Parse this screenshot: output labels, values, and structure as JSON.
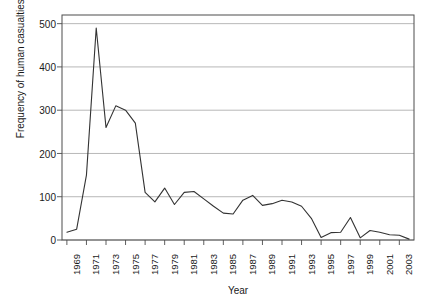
{
  "chart_data": {
    "type": "line",
    "title": "",
    "xlabel": "Year",
    "ylabel": "Frequency of human casualties (death)",
    "xlim": [
      1968.5,
      2004.5
    ],
    "ylim": [
      0,
      520
    ],
    "grid": true,
    "legend": null,
    "y_ticks": [
      500,
      400,
      300,
      200,
      100,
      0
    ],
    "y_tick_labels": [
      "500",
      "400",
      "300",
      "200",
      "100",
      "0"
    ],
    "x_ticks": [
      1969,
      1971,
      1973,
      1975,
      1977,
      1979,
      1981,
      1983,
      1985,
      1987,
      1989,
      1991,
      1993,
      1995,
      1997,
      1999,
      2001,
      2003
    ],
    "x_tick_labels": [
      "1969",
      "1971",
      "1973",
      "1975",
      "1977",
      "1979",
      "1981",
      "1983",
      "1985",
      "1987",
      "1989",
      "1991",
      "1993",
      "1995",
      "1997",
      "1999",
      "2001",
      "2003"
    ],
    "line_color": "#333333",
    "grid_color": "#999999",
    "x": [
      1969,
      1970,
      1971,
      1972,
      1973,
      1974,
      1975,
      1976,
      1977,
      1978,
      1979,
      1980,
      1981,
      1982,
      1983,
      1984,
      1985,
      1986,
      1987,
      1988,
      1989,
      1990,
      1991,
      1992,
      1993,
      1994,
      1995,
      1996,
      1997,
      1998,
      1999,
      2000,
      2001,
      2002,
      2003,
      2004
    ],
    "values": [
      18,
      25,
      150,
      490,
      260,
      310,
      300,
      270,
      110,
      88,
      120,
      82,
      110,
      112,
      95,
      78,
      62,
      60,
      92,
      103,
      80,
      84,
      92,
      88,
      78,
      50,
      6,
      17,
      18,
      52,
      5,
      22,
      18,
      12,
      11,
      2
    ],
    "series": [
      {
        "name": "Frequency of human casualties (death)",
        "values": [
          18,
          25,
          150,
          490,
          260,
          310,
          300,
          270,
          110,
          88,
          120,
          82,
          110,
          112,
          95,
          78,
          62,
          60,
          92,
          103,
          80,
          84,
          92,
          88,
          78,
          50,
          6,
          17,
          18,
          52,
          5,
          22,
          18,
          12,
          11,
          2
        ]
      }
    ]
  },
  "plot": {
    "frame": {
      "left": 62,
      "top": 15,
      "right": 414,
      "bottom": 240
    }
  }
}
